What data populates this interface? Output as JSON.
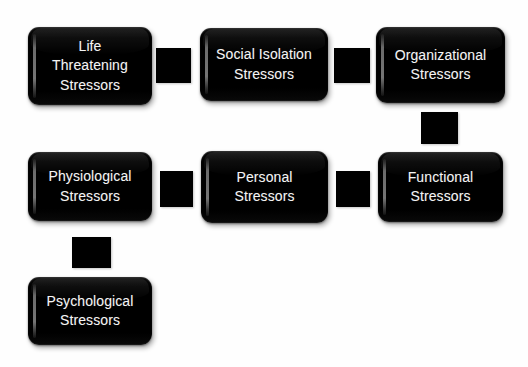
{
  "diagram": {
    "background_color": "#fefefe",
    "node_color": "#000000",
    "node_text_color": "#f4f4f4",
    "connector_color": "#000000",
    "nodes": [
      {
        "id": "life-threatening-stressors",
        "label": "Life\nThreatening\nStressors",
        "x": 28,
        "y": 27,
        "w": 124,
        "h": 78
      },
      {
        "id": "social-isolation-stressors",
        "label": "Social Isolation\nStressors",
        "x": 200,
        "y": 28,
        "w": 128,
        "h": 73
      },
      {
        "id": "organizational-stressors",
        "label": "Organizational\nStressors",
        "x": 376,
        "y": 27,
        "w": 129,
        "h": 76
      },
      {
        "id": "physiological-stressors",
        "label": "Physiological\nStressors",
        "x": 28,
        "y": 152,
        "w": 124,
        "h": 69
      },
      {
        "id": "personal-stressors",
        "label": "Personal\nStressors",
        "x": 201,
        "y": 151,
        "w": 127,
        "h": 72
      },
      {
        "id": "functional-stressors",
        "label": "Functional\nStressors",
        "x": 378,
        "y": 152,
        "w": 125,
        "h": 70
      },
      {
        "id": "psychological-stressors",
        "label": "Psychological\nStressors",
        "x": 28,
        "y": 277,
        "w": 124,
        "h": 68
      }
    ],
    "connectors": [
      {
        "id": "life-threatening-to-social-isolation",
        "orientation": "horizontal",
        "x": 156,
        "y": 48,
        "w": 35,
        "h": 35
      },
      {
        "id": "social-isolation-to-organizational",
        "orientation": "horizontal",
        "x": 334,
        "y": 48,
        "w": 36,
        "h": 35
      },
      {
        "id": "organizational-to-functional",
        "orientation": "vertical",
        "x": 421,
        "y": 112,
        "w": 37,
        "h": 32
      },
      {
        "id": "physiological-to-personal",
        "orientation": "horizontal",
        "x": 160,
        "y": 171,
        "w": 33,
        "h": 36
      },
      {
        "id": "personal-to-functional",
        "orientation": "horizontal",
        "x": 336,
        "y": 171,
        "w": 34,
        "h": 36
      },
      {
        "id": "physiological-to-psychological",
        "orientation": "vertical",
        "x": 72,
        "y": 237,
        "w": 39,
        "h": 31
      }
    ]
  }
}
